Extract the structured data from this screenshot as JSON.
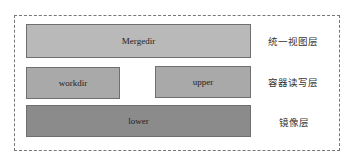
{
  "diagram": {
    "type": "layered-stack",
    "frame_style": "dashed",
    "colors": {
      "merge_layer": "#b9b9b9",
      "container_layer": "#a9a9a9",
      "image_layer": "#8b8b8b",
      "border": "#6f6f6f",
      "frame": "#777777"
    },
    "layers": [
      {
        "id": "merge",
        "boxes": [
          {
            "label": "Mergedir"
          }
        ],
        "side_label": "统一视图层"
      },
      {
        "id": "container",
        "boxes": [
          {
            "label": "workdir"
          },
          {
            "label": "upper"
          }
        ],
        "side_label": "容器读写层"
      },
      {
        "id": "image",
        "boxes": [
          {
            "label": "lower"
          }
        ],
        "side_label": "镜像层"
      }
    ]
  }
}
